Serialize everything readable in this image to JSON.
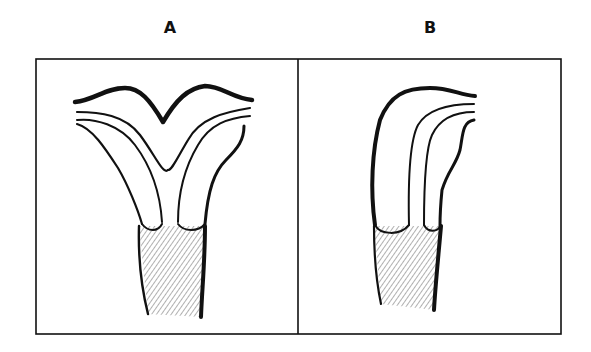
{
  "figure": {
    "panels": [
      {
        "id": "A",
        "label": "A",
        "description": "bifurcated (two-horned) structure with shaded stalk"
      },
      {
        "id": "B",
        "label": "B",
        "description": "single curved structure with shaded stalk"
      }
    ],
    "colors": {
      "ink": "#111111",
      "background": "#ffffff"
    }
  }
}
